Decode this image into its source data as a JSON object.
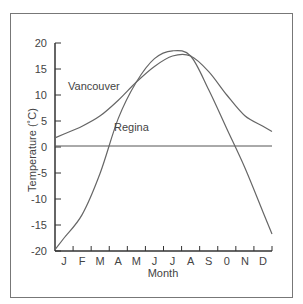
{
  "chart_data": {
    "type": "line",
    "title": "",
    "xlabel": "Month",
    "ylabel": "Temperature (°C)",
    "categories": [
      "J",
      "F",
      "M",
      "A",
      "M",
      "J",
      "J",
      "A",
      "S",
      "0",
      "N",
      "D"
    ],
    "yticks": [
      20,
      15,
      10,
      5,
      0,
      -5,
      -10,
      -15,
      -20
    ],
    "ylim": [
      -20,
      20
    ],
    "grid": false,
    "legend": "inline labels",
    "series": [
      {
        "name": "Vancouver",
        "values": [
          2.5,
          4.0,
          6.0,
          9.0,
          12.5,
          15.5,
          17.5,
          17.5,
          14.5,
          10.0,
          6.0,
          4.0
        ]
      },
      {
        "name": "Regina",
        "values": [
          -17.5,
          -13.0,
          -5.0,
          5.5,
          12.5,
          17.0,
          18.5,
          17.5,
          11.0,
          3.5,
          -4.0,
          -12.5
        ]
      }
    ]
  },
  "labels": {
    "vancouver": "Vancouver",
    "regina": "Regina",
    "xlabel": "Month",
    "ylabel": "Temperature (˚C)"
  }
}
